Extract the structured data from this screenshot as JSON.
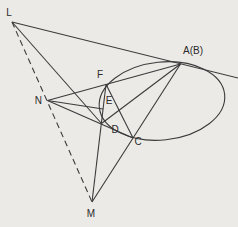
{
  "figure": {
    "background_color": "#eceae7",
    "stroke_color": "#3b3b3b",
    "label_color": "#2b2b2b",
    "stroke_width": 1.1,
    "dash_pattern": "6,4",
    "width": 238,
    "height": 227
  },
  "conic": {
    "name": "ellipse",
    "cx": 162,
    "cy": 101,
    "rx": 63,
    "ry": 39,
    "rotate_deg": -6
  },
  "points": {
    "L": {
      "x": 12,
      "y": 22
    },
    "M": {
      "x": 92,
      "y": 202
    },
    "N": {
      "x": 47.5,
      "y": 100.5
    },
    "A": {
      "x": 180.5,
      "y": 64
    },
    "F": {
      "x": 106,
      "y": 84.2
    },
    "E": {
      "x": 103,
      "y": 109
    },
    "D": {
      "x": 101.5,
      "y": 123.5
    },
    "C": {
      "x": 133,
      "y": 138
    },
    "tangent_end": {
      "x": 238,
      "y": 78
    }
  },
  "lines": [
    {
      "name": "line-L-tangent-AB",
      "from": "L",
      "to": "tangent_end",
      "dashed": false
    },
    {
      "name": "line-L-D",
      "from": "L",
      "to": "D",
      "dashed": false
    },
    {
      "name": "line-L-M-dashed",
      "from": "L",
      "to": "M",
      "dashed": true
    },
    {
      "name": "line-M-C-AB",
      "from": "M",
      "to": "A",
      "dashed": false
    },
    {
      "name": "line-M-D-F",
      "from": "M",
      "to": "F",
      "dashed": false
    },
    {
      "name": "line-N-F-AB",
      "from": "N",
      "to": "A",
      "dashed": false
    },
    {
      "name": "line-N-D-C",
      "from": "N",
      "to": "C",
      "dashed": false
    },
    {
      "name": "line-N-E",
      "from": "N",
      "to": "E",
      "dashed": false
    },
    {
      "name": "line-A-D",
      "from": "A",
      "to": "D",
      "dashed": false
    },
    {
      "name": "line-F-C",
      "from": "F",
      "to": "C",
      "dashed": false
    }
  ],
  "labels": [
    {
      "name": "label-L",
      "text": "L",
      "x": 9,
      "y": 16,
      "anchor": "middle",
      "size": 10
    },
    {
      "name": "label-N",
      "text": "N",
      "x": 42,
      "y": 104,
      "anchor": "end",
      "size": 10
    },
    {
      "name": "label-M",
      "text": "M",
      "x": 91,
      "y": 217,
      "anchor": "middle",
      "size": 10
    },
    {
      "name": "label-AB",
      "text": "A(B)",
      "x": 193,
      "y": 54,
      "anchor": "middle",
      "size": 10
    },
    {
      "name": "label-F",
      "text": "F",
      "x": 100,
      "y": 78,
      "anchor": "middle",
      "size": 10
    },
    {
      "name": "label-E",
      "text": "E",
      "x": 109,
      "y": 104,
      "anchor": "middle",
      "size": 10
    },
    {
      "name": "label-D",
      "text": "D",
      "x": 115,
      "y": 133,
      "anchor": "middle",
      "size": 10
    },
    {
      "name": "label-C",
      "text": "C",
      "x": 138,
      "y": 145,
      "anchor": "middle",
      "size": 10
    }
  ]
}
